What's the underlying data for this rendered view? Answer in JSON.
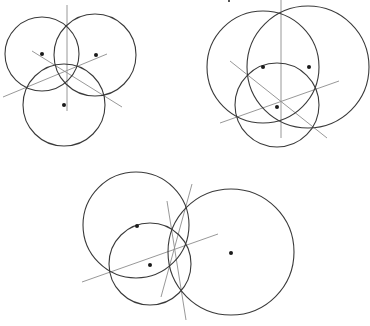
{
  "diagram": {
    "colors": {
      "circle_stroke": "#3a3a3a",
      "line_stroke": "#8c8c8c",
      "dot_fill": "#1a1a1a",
      "background": "#ffffff"
    },
    "figures": [
      {
        "name": "figure-top-left",
        "circles": [
          {
            "cx": 42,
            "cy": 54,
            "r": 37
          },
          {
            "cx": 95,
            "cy": 55,
            "r": 41
          },
          {
            "cx": 64,
            "cy": 105,
            "r": 41
          }
        ],
        "dots": [
          {
            "x": 42,
            "y": 54
          },
          {
            "x": 96,
            "y": 55
          },
          {
            "x": 64,
            "y": 105
          }
        ],
        "lines": [
          {
            "x1": 67,
            "y1": 5,
            "x2": 67,
            "y2": 111
          },
          {
            "x1": 32,
            "y1": 51,
            "x2": 122,
            "y2": 107
          },
          {
            "x1": 3,
            "y1": 97,
            "x2": 107,
            "y2": 54
          }
        ]
      },
      {
        "name": "figure-top-right",
        "circles": [
          {
            "cx": 263,
            "cy": 67,
            "r": 56
          },
          {
            "cx": 308,
            "cy": 67,
            "r": 61
          },
          {
            "cx": 277,
            "cy": 105,
            "r": 42
          }
        ],
        "dots": [
          {
            "x": 263,
            "y": 67
          },
          {
            "x": 309,
            "y": 67
          },
          {
            "x": 277,
            "y": 107
          }
        ],
        "lines": [
          {
            "x1": 281,
            "y1": 0,
            "x2": 281,
            "y2": 138
          },
          {
            "x1": 230,
            "y1": 61,
            "x2": 327,
            "y2": 138
          },
          {
            "x1": 220,
            "y1": 123,
            "x2": 339,
            "y2": 81
          }
        ]
      },
      {
        "name": "figure-bottom",
        "circles": [
          {
            "cx": 136,
            "cy": 225,
            "r": 53
          },
          {
            "cx": 150,
            "cy": 264,
            "r": 41
          },
          {
            "cx": 231,
            "cy": 252,
            "r": 63
          }
        ],
        "dots": [
          {
            "x": 137,
            "y": 226
          },
          {
            "x": 150,
            "y": 265
          },
          {
            "x": 231,
            "y": 253
          }
        ],
        "lines": [
          {
            "x1": 167,
            "y1": 201,
            "x2": 186,
            "y2": 320
          },
          {
            "x1": 192,
            "y1": 184,
            "x2": 161,
            "y2": 297
          },
          {
            "x1": 82,
            "y1": 282,
            "x2": 218,
            "y2": 234
          }
        ]
      }
    ]
  }
}
